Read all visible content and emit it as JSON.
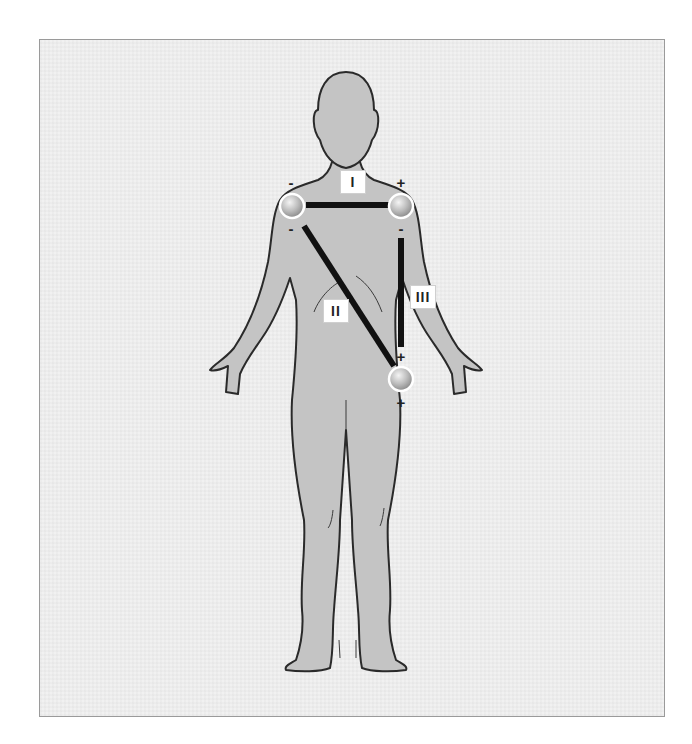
{
  "diagram": {
    "colors": {
      "background": "#f1f1f1",
      "frame_border": "#9a9a9a",
      "body_fill": "#c4c4c4",
      "body_outline": "#2a2a2a",
      "lead_line": "#111111",
      "label_bg": "#ffffff"
    },
    "leads": [
      {
        "id": "I",
        "label": "I",
        "from": "right-arm",
        "to": "left-arm"
      },
      {
        "id": "II",
        "label": "II",
        "from": "right-arm",
        "to": "left-leg"
      },
      {
        "id": "III",
        "label": "III",
        "from": "left-arm",
        "to": "left-leg"
      }
    ],
    "electrodes": [
      {
        "id": "right-arm",
        "polarity_top": "-",
        "polarity_bottom": "-"
      },
      {
        "id": "left-arm",
        "polarity_top": "+",
        "polarity_bottom": "-"
      },
      {
        "id": "left-leg",
        "polarity_top": "+",
        "polarity_bottom": "+"
      }
    ]
  }
}
